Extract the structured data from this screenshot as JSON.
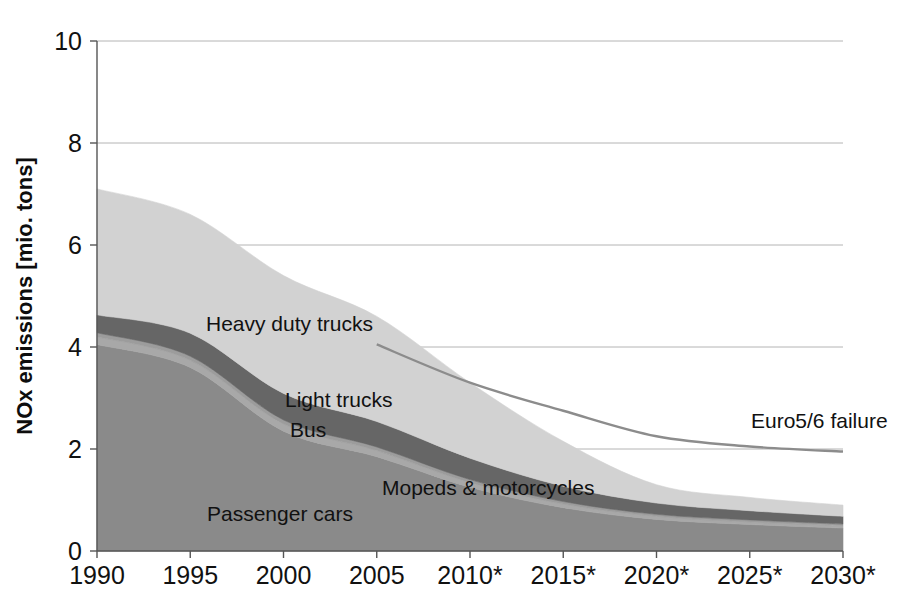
{
  "chart_data": {
    "type": "area",
    "title": "",
    "subtitle": "",
    "xlabel": "",
    "ylabel": "NOx emissions [mio. tons]",
    "stacked": true,
    "grid": true,
    "legend_position": "inline-labels",
    "xlim": [
      1990,
      2030
    ],
    "ylim": [
      0,
      10
    ],
    "yticks": [
      "0",
      "2",
      "4",
      "6",
      "8",
      "10"
    ],
    "ytick_values": [
      0,
      2,
      4,
      6,
      8,
      10
    ],
    "categories": [
      "1990",
      "1995",
      "2000",
      "2005",
      "2010*",
      "2015*",
      "2020*",
      "2025*",
      "2030*"
    ],
    "x": [
      1990,
      1995,
      2000,
      2005,
      2010,
      2015,
      2020,
      2025,
      2030
    ],
    "series": [
      {
        "name": "Passenger cars",
        "color": "#8a8a8a",
        "values": [
          4.05,
          3.6,
          2.35,
          1.85,
          1.25,
          0.85,
          0.62,
          0.52,
          0.45
        ]
      },
      {
        "name": "Mopeds & motorcycles",
        "color": "#a8a8a8",
        "values": [
          0.15,
          0.14,
          0.14,
          0.12,
          0.09,
          0.07,
          0.06,
          0.05,
          0.05
        ]
      },
      {
        "name": "Bus",
        "color": "#9c9c9c",
        "values": [
          0.08,
          0.08,
          0.08,
          0.07,
          0.06,
          0.05,
          0.04,
          0.04,
          0.03
        ]
      },
      {
        "name": "Light trucks",
        "color": "#666666",
        "values": [
          0.35,
          0.45,
          0.52,
          0.5,
          0.42,
          0.3,
          0.22,
          0.18,
          0.15
        ]
      },
      {
        "name": "Heavy duty trucks",
        "color": "#d2d2d2",
        "values": [
          2.47,
          2.33,
          2.31,
          2.06,
          1.48,
          0.88,
          0.36,
          0.26,
          0.22
        ]
      }
    ],
    "annotations": [
      {
        "name": "euro5-6-failure",
        "label": "Euro5/6 failure",
        "color": "#8c8c8c",
        "type": "line",
        "x": [
          2005,
          2010,
          2015,
          2020,
          2025,
          2030
        ],
        "values": [
          4.05,
          3.3,
          2.75,
          2.25,
          2.05,
          1.95
        ]
      }
    ],
    "series_labels": [
      {
        "name": "Heavy duty trucks",
        "text": "Heavy duty trucks",
        "x": 206,
        "y": 331
      },
      {
        "name": "Light trucks",
        "text": "Light trucks",
        "x": 285,
        "y": 407
      },
      {
        "name": "Bus",
        "text": "Bus",
        "x": 290,
        "y": 437
      },
      {
        "name": "Mopeds & motorcycles",
        "text": "Mopeds & motorcycles",
        "x": 382,
        "y": 495
      },
      {
        "name": "Passenger cars",
        "text": "Passenger cars",
        "x": 207,
        "y": 521
      }
    ],
    "annotation_labels": [
      {
        "name": "Euro5/6 failure",
        "text": "Euro5/6 failure",
        "x": 751,
        "y": 428
      }
    ],
    "colors": {
      "axis": "#555555",
      "grid": "#b4b4b4",
      "text": "#111111",
      "background": "#ffffff"
    }
  }
}
